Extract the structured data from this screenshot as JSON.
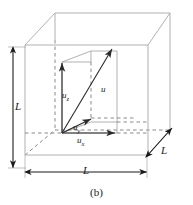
{
  "figure": {
    "caption": "(b)",
    "dimension_labels": {
      "height": "L",
      "width": "L",
      "depth": "L"
    },
    "vectors": {
      "resultant": "u",
      "z_component": "u",
      "z_sub": "z",
      "y_component": "u",
      "y_sub": "y",
      "x_component": "u",
      "x_sub": "x"
    },
    "colors": {
      "box_line": "#a8a8a8",
      "vector_line": "#3a3a3a",
      "dashed_line": "#888888",
      "text": "#1a1a1a",
      "background": "#ffffff"
    }
  }
}
